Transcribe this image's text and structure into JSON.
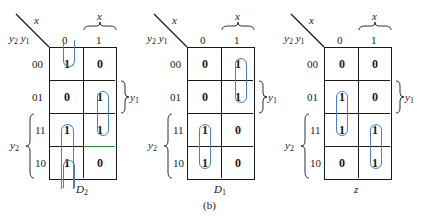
{
  "figure_caption": "(b)",
  "axis": {
    "column_variable": "x",
    "row_variables": "y2 y1",
    "column_labels": [
      "0",
      "1"
    ],
    "row_labels": [
      "00",
      "01",
      "11",
      "10"
    ],
    "brace_x_label": "x",
    "brace_y1_label": "y1",
    "brace_y2_label": "y2"
  },
  "maps": [
    {
      "name": "D2",
      "title_main": "D",
      "title_sub": "2",
      "values": [
        [
          "1",
          "0"
        ],
        [
          "0",
          "1"
        ],
        [
          "1",
          "1"
        ],
        [
          "1",
          "0"
        ]
      ],
      "groups": [
        {
          "cells": "column x=0, rows 00..10 wrap (00 and 10)",
          "type": "wrap-vertical"
        },
        {
          "cells": "x=1, rows 01-11"
        },
        {
          "cells": "x=0, rows 11-10"
        }
      ]
    },
    {
      "name": "D1",
      "title_main": "D",
      "title_sub": "1",
      "values": [
        [
          "0",
          "1"
        ],
        [
          "0",
          "1"
        ],
        [
          "1",
          "0"
        ],
        [
          "1",
          "0"
        ]
      ],
      "groups": [
        {
          "cells": "x=1, rows 00-01"
        },
        {
          "cells": "x=0, rows 11-10"
        }
      ]
    },
    {
      "name": "z",
      "title_main": "z",
      "title_sub": "",
      "values": [
        [
          "0",
          "0"
        ],
        [
          "1",
          "0"
        ],
        [
          "1",
          "1"
        ],
        [
          "0",
          "1"
        ]
      ],
      "groups": [
        {
          "cells": "x=0, rows 01-11"
        },
        {
          "cells": "x=1, rows 11-10"
        }
      ]
    }
  ],
  "colors": {
    "loop": "#4a7fc1",
    "grid": "#1a1a1a"
  }
}
